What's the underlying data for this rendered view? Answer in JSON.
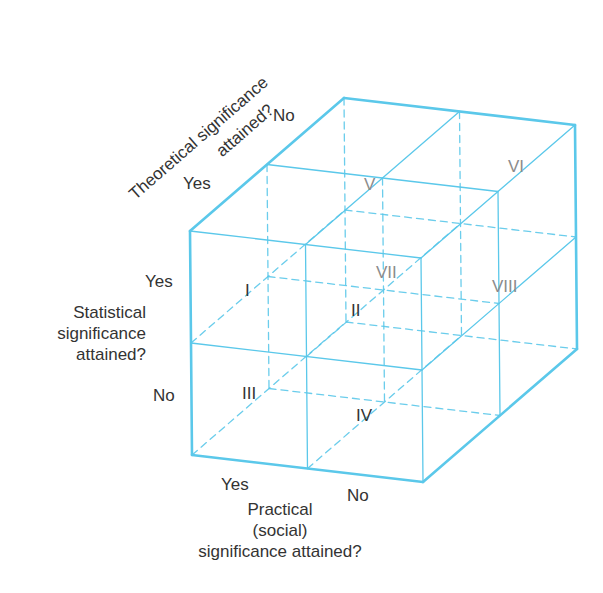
{
  "theme": {
    "line_color": "#5bc8ea",
    "text_color": "#333333",
    "back_label_color": "#8c8c8c"
  },
  "axes": {
    "theoretical": {
      "title_line1": "Theoretical significance",
      "title_line2": "attained?",
      "yes": "Yes",
      "no": "No"
    },
    "statistical": {
      "title_lines": [
        "Statistical",
        "significance",
        "attained?"
      ],
      "yes": "Yes",
      "no": "No"
    },
    "practical": {
      "title_lines": [
        "Practical",
        "(social)",
        "significance attained?"
      ],
      "yes": "Yes",
      "no": "No"
    }
  },
  "cells": [
    {
      "id": "I",
      "label": "I",
      "front": true
    },
    {
      "id": "II",
      "label": "II",
      "front": true
    },
    {
      "id": "III",
      "label": "III",
      "front": true
    },
    {
      "id": "IV",
      "label": "IV",
      "front": true
    },
    {
      "id": "V",
      "label": "V",
      "front": false
    },
    {
      "id": "VI",
      "label": "VI",
      "front": false
    },
    {
      "id": "VII",
      "label": "VII",
      "front": false
    },
    {
      "id": "VIII",
      "label": "VIII",
      "front": false
    }
  ],
  "geometry": {
    "origin": [
      190,
      231
    ],
    "width_vec": [
      231,
      27
    ],
    "height_vec": [
      2,
      224
    ],
    "depth_vec": [
      154,
      -133
    ]
  }
}
